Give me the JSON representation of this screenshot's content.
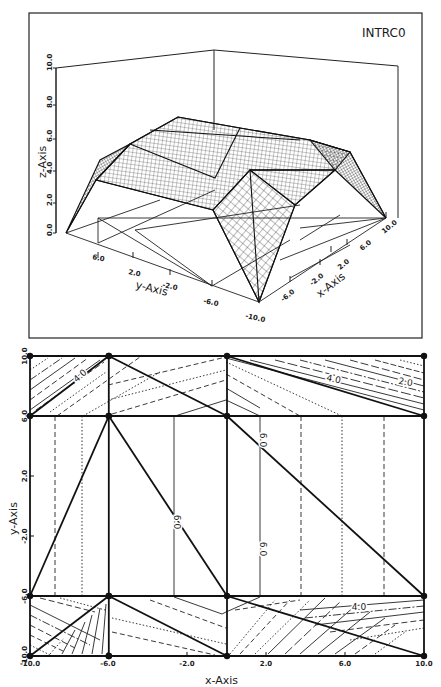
{
  "chart_data": [
    {
      "type": "surface3d",
      "title": "INTRC0",
      "xlabel": "x-Axis",
      "ylabel": "y-Axis",
      "zlabel": "z-Axis",
      "x_ticks": [
        "-6.0",
        "-2.0",
        "2.0",
        "6.0",
        "10.0"
      ],
      "y_ticks": [
        "6.0",
        "2.0",
        "-2.0",
        "-6.0",
        "-10.0"
      ],
      "z_ticks": [
        "0.0",
        "2.0",
        "4.0",
        "6.0",
        "8.0",
        "10.0"
      ],
      "xlim": [
        -10,
        10
      ],
      "ylim": [
        -10,
        10
      ],
      "zlim": [
        0,
        10
      ],
      "grid": false,
      "description": "Piecewise-linear interpolated surface (wireframe mesh) over triangulated scattered nodes; plateau near z~6 with edges dropping to 0 at domain corners"
    },
    {
      "type": "contour",
      "xlabel": "x-Axis",
      "ylabel": "y-Axis",
      "x_ticks": [
        "-10.0",
        "-6.0",
        "-2.0",
        "2.0",
        "6.0",
        "10.0"
      ],
      "y_ticks": [
        "10.0",
        "6.0",
        "2.0",
        "-2.0",
        "-6.0",
        "-10.0"
      ],
      "xlim": [
        -10,
        10
      ],
      "ylim": [
        -10,
        10
      ],
      "contour_labels": [
        "4.0",
        "4.0",
        "2.0",
        "6.0",
        "6.0",
        "6.0",
        "4.0"
      ],
      "node_x": [
        -10,
        -6,
        0,
        10
      ],
      "node_y": [
        10,
        6,
        -6,
        -10
      ],
      "triangulation_edges": [
        [
          [
            -10,
            10
          ],
          [
            -6,
            10
          ]
        ],
        [
          [
            -6,
            10
          ],
          [
            0,
            10
          ]
        ],
        [
          [
            0,
            10
          ],
          [
            10,
            10
          ]
        ],
        [
          [
            -10,
            6
          ],
          [
            10,
            6
          ]
        ],
        [
          [
            -10,
            -6
          ],
          [
            10,
            -6
          ]
        ],
        [
          [
            -10,
            -10
          ],
          [
            10,
            -10
          ]
        ],
        [
          [
            -10,
            10
          ],
          [
            -10,
            -10
          ]
        ],
        [
          [
            -6,
            10
          ],
          [
            -6,
            -10
          ]
        ],
        [
          [
            0,
            10
          ],
          [
            0,
            -10
          ]
        ],
        [
          [
            10,
            10
          ],
          [
            10,
            -10
          ]
        ],
        [
          [
            -10,
            6
          ],
          [
            -6,
            10
          ]
        ],
        [
          [
            -6,
            10
          ],
          [
            0,
            6
          ]
        ],
        [
          [
            0,
            10
          ],
          [
            10,
            6
          ]
        ],
        [
          [
            -10,
            -6
          ],
          [
            -6,
            6
          ]
        ],
        [
          [
            -6,
            6
          ],
          [
            0,
            -6
          ]
        ],
        [
          [
            0,
            6
          ],
          [
            10,
            -6
          ]
        ],
        [
          [
            -10,
            -10
          ],
          [
            -6,
            -6
          ]
        ],
        [
          [
            -6,
            -6
          ],
          [
            0,
            -10
          ]
        ],
        [
          [
            0,
            -6
          ],
          [
            10,
            -10
          ]
        ]
      ]
    }
  ],
  "surface_panel": {
    "title": "INTRC0",
    "z_axis_label": "z-Axis",
    "y_axis_label": "y-Axis",
    "x_axis_label": "x-Axis",
    "z_ticks": [
      {
        "label": "0.0",
        "y": 233
      },
      {
        "label": "2.0",
        "y": 203
      },
      {
        "label": "4.0",
        "y": 171
      },
      {
        "label": "6.0",
        "y": 139
      },
      {
        "label": "8.0",
        "y": 105
      },
      {
        "label": "10.0",
        "y": 68
      }
    ],
    "y_ticks": [
      {
        "label": "6.0",
        "x": 98,
        "y": 258,
        "tx": 92,
        "ty": 259
      },
      {
        "label": "2.0",
        "x": 133,
        "y": 258,
        "tx": 128,
        "ty": 274
      },
      {
        "label": "-2.0",
        "x": 170,
        "y": 275,
        "tx": 162,
        "ty": 287
      },
      {
        "label": "-6.0",
        "x": 212,
        "y": 286,
        "tx": 203,
        "ty": 303
      },
      {
        "label": "-10.0",
        "x": 259,
        "y": 302,
        "tx": 245,
        "ty": 318
      }
    ],
    "x_ticks": [
      {
        "label": "-6.0",
        "x": 290,
        "y": 282,
        "tx": 283,
        "ty": 302
      },
      {
        "label": "-2.0",
        "x": 320,
        "y": 265,
        "tx": 312,
        "ty": 286
      },
      {
        "label": "2.0",
        "x": 331,
        "y": 252,
        "tx": 340,
        "ty": 270
      },
      {
        "label": "6.0",
        "x": 347,
        "y": 245,
        "tx": 362,
        "ty": 251
      },
      {
        "label": "10.0",
        "x": 386,
        "y": 218,
        "tx": 384,
        "ty": 234
      }
    ]
  },
  "contour_panel": {
    "x_axis_label": "x-Axis",
    "y_axis_label": "y-Axis",
    "x_ticks": [
      {
        "label": "-10.0",
        "x": 30
      },
      {
        "label": "-6.0",
        "x": 108
      },
      {
        "label": "-2.0",
        "x": 187
      },
      {
        "label": "2.0",
        "x": 266
      },
      {
        "label": "6.0",
        "x": 345
      },
      {
        "label": "10.0",
        "x": 424
      }
    ],
    "y_ticks": [
      {
        "label": "10.0",
        "y": 356
      },
      {
        "label": "6.0",
        "y": 416
      },
      {
        "label": "2.0",
        "y": 476
      },
      {
        "label": "-2.0",
        "y": 536
      },
      {
        "label": "-6.0",
        "y": 596
      },
      {
        "label": "-10.0",
        "y": 656
      }
    ],
    "labels": [
      {
        "text": "4.0",
        "x": 82,
        "y": 378,
        "rot": -42
      },
      {
        "text": "4.0",
        "x": 333,
        "y": 382,
        "rot": 12
      },
      {
        "text": "2.0",
        "x": 405,
        "y": 385,
        "rot": 10
      },
      {
        "text": "6.0",
        "x": 174,
        "y": 522,
        "rot": 90
      },
      {
        "text": "6.0",
        "x": 260,
        "y": 440,
        "rot": 90
      },
      {
        "text": "6.0",
        "x": 260,
        "y": 549,
        "rot": 90
      },
      {
        "text": "4.0",
        "x": 359,
        "y": 610,
        "rot": 0
      }
    ]
  }
}
